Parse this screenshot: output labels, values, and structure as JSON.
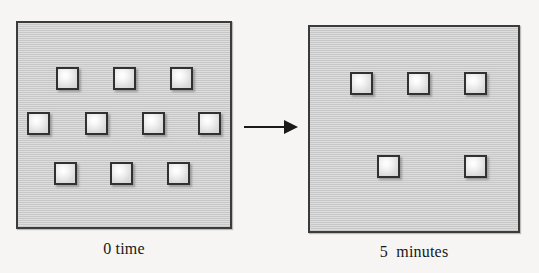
{
  "figure": {
    "background_color": "#f6f5f3",
    "panel_fill_color": "#cfcfcf",
    "panel_border_color": "#3b3b3b",
    "particle_border_color": "#313131",
    "arrow_color": "#1a1a1a"
  },
  "panels": [
    {
      "id": "left",
      "caption": "0 time",
      "particle_count": 10,
      "rows": [
        3,
        4,
        3
      ],
      "particles": [
        {
          "x": 38,
          "y": 44
        },
        {
          "x": 95,
          "y": 44
        },
        {
          "x": 152,
          "y": 44
        },
        {
          "x": 9,
          "y": 89
        },
        {
          "x": 67,
          "y": 89
        },
        {
          "x": 124,
          "y": 89
        },
        {
          "x": 180,
          "y": 89
        },
        {
          "x": 36,
          "y": 139
        },
        {
          "x": 92,
          "y": 139
        },
        {
          "x": 149,
          "y": 139
        }
      ]
    },
    {
      "id": "right",
      "caption": "5  minutes",
      "particle_count": 5,
      "rows": [
        3,
        2
      ],
      "particles": [
        {
          "x": 40,
          "y": 45
        },
        {
          "x": 97,
          "y": 45
        },
        {
          "x": 154,
          "y": 45
        },
        {
          "x": 67,
          "y": 128
        },
        {
          "x": 154,
          "y": 128
        }
      ]
    }
  ],
  "arrow": {
    "label": "",
    "direction": "right"
  }
}
